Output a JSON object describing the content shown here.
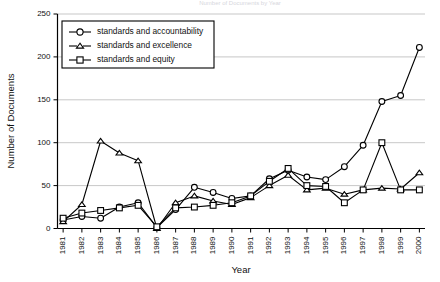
{
  "chart_data": {
    "type": "line",
    "title": "Number of Documents by Year",
    "xlabel": "Year",
    "ylabel": "Number of Documents",
    "ylim": [
      0,
      250
    ],
    "yticks": [
      0,
      50,
      100,
      150,
      200,
      250
    ],
    "grid": true,
    "legend_position": "top-left",
    "categories": [
      "1981",
      "1982",
      "1983",
      "1984",
      "1985",
      "1986",
      "1987",
      "1988",
      "1989",
      "1990",
      "1991",
      "1992",
      "1993",
      "1994",
      "1995",
      "1996",
      "1997",
      "1998",
      "1999",
      "2000"
    ],
    "series": [
      {
        "name": "standards and accountability",
        "marker": "circle",
        "values": [
          10,
          14,
          12,
          25,
          30,
          1,
          22,
          48,
          42,
          35,
          38,
          58,
          68,
          60,
          57,
          72,
          97,
          148,
          155,
          211
        ]
      },
      {
        "name": "standards and excellence",
        "marker": "triangle",
        "values": [
          8,
          28,
          102,
          88,
          79,
          0,
          30,
          38,
          32,
          28,
          36,
          50,
          62,
          45,
          47,
          40,
          45,
          47,
          46,
          65
        ]
      },
      {
        "name": "standards and equity",
        "marker": "square",
        "values": [
          12,
          18,
          21,
          24,
          27,
          2,
          24,
          25,
          27,
          30,
          38,
          55,
          70,
          50,
          49,
          30,
          45,
          100,
          45,
          45
        ]
      }
    ]
  },
  "legend": {
    "items": [
      {
        "label": "standards and accountability",
        "marker": "circle"
      },
      {
        "label": "standards and excellence",
        "marker": "triangle"
      },
      {
        "label": "standards and equity",
        "marker": "square"
      }
    ]
  }
}
